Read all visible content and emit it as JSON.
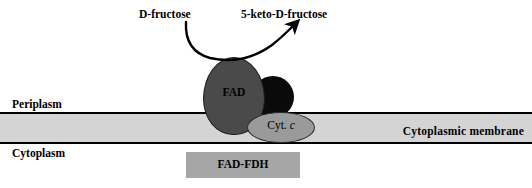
{
  "diagram": {
    "compartments": {
      "periplasm_label": "Periplasm",
      "cytoplasm_label": "Cytoplasm",
      "membrane_label": "Cytoplasmic membrane"
    },
    "reaction": {
      "substrate_label": "D-fructose",
      "product_label": "5-keto-D-fructose",
      "arrow_name": "curved-reaction-arrow"
    },
    "enzyme": {
      "complex_label": "FAD-FDH",
      "subunits": [
        {
          "label": "FAD",
          "shape": "egg",
          "color": "#4a4a4a"
        },
        {
          "label": "",
          "shape": "circle",
          "color": "#0a0a0a"
        },
        {
          "label_prefix": "Cyt. ",
          "label_italic": "c",
          "shape": "ellipse",
          "color": "#9a9a9a"
        }
      ]
    },
    "colors": {
      "membrane_fill": "#d4d4d4",
      "membrane_line": "#000000",
      "fad_fill": "#4a4a4a",
      "heme_fill": "#0a0a0a",
      "cytc_fill": "#9a9a9a",
      "box_fill": "#a6a6a6",
      "text": "#000000",
      "background": "#ffffff"
    }
  }
}
